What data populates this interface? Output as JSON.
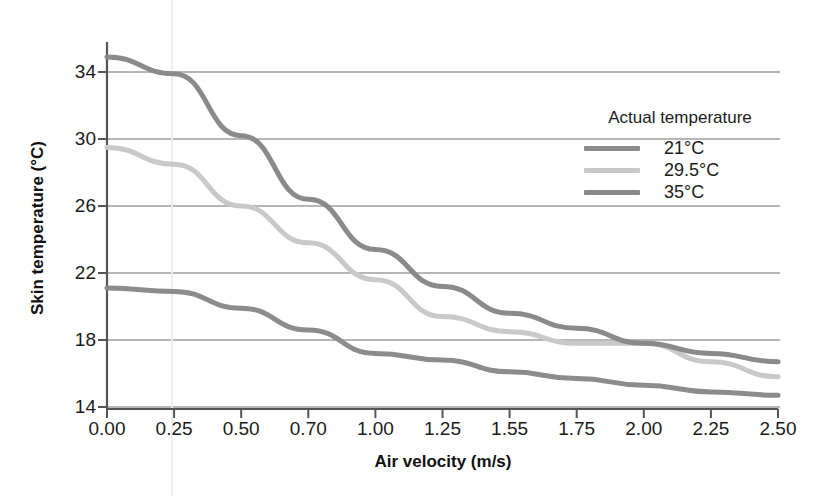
{
  "chart_data": {
    "type": "line",
    "title": "",
    "xlabel": "Air velocity (m/s)",
    "ylabel": "Skin temperature (°C)",
    "categories": [
      "0.00",
      "0.25",
      "0.50",
      "0.70",
      "1.00",
      "1.25",
      "1.55",
      "1.75",
      "2.00",
      "2.25",
      "2.50"
    ],
    "ylim": [
      14,
      36
    ],
    "yticks": [
      14,
      18,
      22,
      26,
      30,
      34
    ],
    "grid": "horizontal",
    "legend_position": "upper-right",
    "legend_title": "Actual temperature",
    "series": [
      {
        "name": "21°C",
        "color": "#8c8c8c",
        "values": [
          21.1,
          20.9,
          19.9,
          18.6,
          17.2,
          16.8,
          16.1,
          15.7,
          15.3,
          14.9,
          14.7
        ]
      },
      {
        "name": "29.5°C",
        "color": "#c9c9c9",
        "values": [
          29.5,
          28.5,
          26.0,
          23.8,
          21.6,
          19.4,
          18.5,
          17.8,
          17.8,
          16.7,
          15.8
        ]
      },
      {
        "name": "35°C",
        "color": "#8a8a8a",
        "values": [
          34.9,
          33.9,
          30.2,
          26.4,
          23.4,
          21.2,
          19.6,
          18.7,
          17.8,
          17.2,
          16.7
        ]
      }
    ]
  },
  "axes": {
    "y_tick_labels": [
      "34",
      "30",
      "26",
      "22",
      "18",
      "14"
    ],
    "x_tick_labels": [
      "0.00",
      "0.25",
      "0.50",
      "0.70",
      "1.00",
      "1.25",
      "1.55",
      "1.75",
      "2.00",
      "2.25",
      "2.50"
    ]
  },
  "legend": {
    "title": "Actual temperature",
    "items": [
      {
        "label": "21°C",
        "color": "#8c8c8c"
      },
      {
        "label": "29.5°C",
        "color": "#c9c9c9"
      },
      {
        "label": "35°C",
        "color": "#8a8a8a"
      }
    ]
  },
  "style": {
    "axis_color": "#555555",
    "grid_color": "#6e6e6e",
    "text_color": "#1b1b1b",
    "background": "#ffffff"
  }
}
